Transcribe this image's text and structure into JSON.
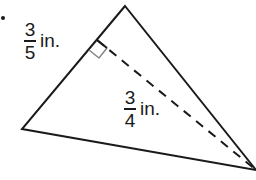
{
  "diagram": {
    "type": "triangle-with-altitude",
    "vertices": {
      "top": [
        125,
        6
      ],
      "left": [
        22,
        129
      ],
      "right": [
        256,
        170
      ]
    },
    "altitude_foot": [
      97,
      40
    ],
    "colors": {
      "stroke": "#1a1a1a",
      "right_angle_marker": "#888888"
    },
    "labels": {
      "side_label": {
        "numerator": "3",
        "denominator": "5",
        "unit": "in."
      },
      "height_label": {
        "numerator": "3",
        "denominator": "4",
        "unit": "in."
      }
    }
  }
}
